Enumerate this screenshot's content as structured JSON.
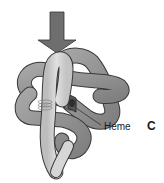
{
  "figure": {
    "panel_label": "C",
    "annotations": [
      {
        "label": "Heme",
        "target": "heme-group"
      }
    ],
    "elements": {
      "arrow": {
        "direction": "down",
        "color": "#6e6e6e"
      },
      "protein_ribbon": {
        "type": "globin-fold-tube",
        "dark_color": "#8f8f8f",
        "light_color": "#cfcfcf",
        "outline": "#3a3a3a"
      },
      "heme_group": {
        "color": "#555555"
      }
    }
  }
}
